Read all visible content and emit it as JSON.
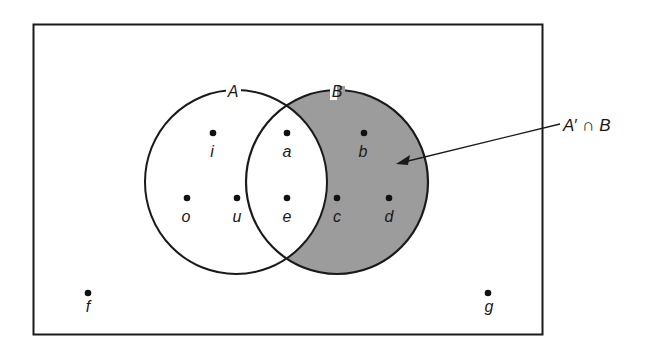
{
  "diagram": {
    "type": "venn",
    "colors": {
      "stroke": "#1a1a1a",
      "shade": "#9c9c9c",
      "background": "#ffffff"
    },
    "universe": {
      "x": 33,
      "y": 24,
      "width": 510,
      "height": 310
    },
    "sets": [
      {
        "name": "A",
        "label": "A",
        "cx": 236,
        "cy": 182,
        "rx": 91,
        "ry": 92,
        "label_x": 233,
        "label_y": 98
      },
      {
        "name": "B",
        "label": "B",
        "cx": 337,
        "cy": 182,
        "rx": 91,
        "ry": 92,
        "label_x": 337,
        "label_y": 98
      }
    ],
    "shaded_region": "A' ∩ B",
    "elements": [
      {
        "label": "i",
        "x": 213,
        "y": 133,
        "region": "A only"
      },
      {
        "label": "a",
        "x": 287,
        "y": 133,
        "region": "A ∩ B"
      },
      {
        "label": "b",
        "x": 364,
        "y": 133,
        "region": "B only"
      },
      {
        "label": "o",
        "x": 187,
        "y": 198,
        "region": "A only"
      },
      {
        "label": "u",
        "x": 237,
        "y": 198,
        "region": "A only"
      },
      {
        "label": "e",
        "x": 287,
        "y": 198,
        "region": "A ∩ B"
      },
      {
        "label": "c",
        "x": 337,
        "y": 198,
        "region": "B only"
      },
      {
        "label": "d",
        "x": 389,
        "y": 198,
        "region": "B only"
      },
      {
        "label": "f",
        "x": 88,
        "y": 293,
        "region": "outside"
      },
      {
        "label": "g",
        "x": 488,
        "y": 293,
        "region": "outside"
      }
    ],
    "annotation": {
      "text_A": "A",
      "text_prime": "′",
      "text_cap": " ∩ ",
      "text_B": "B",
      "x": 563,
      "y": 131,
      "arrow_from": [
        560,
        124
      ],
      "arrow_to": [
        397,
        164
      ]
    }
  }
}
